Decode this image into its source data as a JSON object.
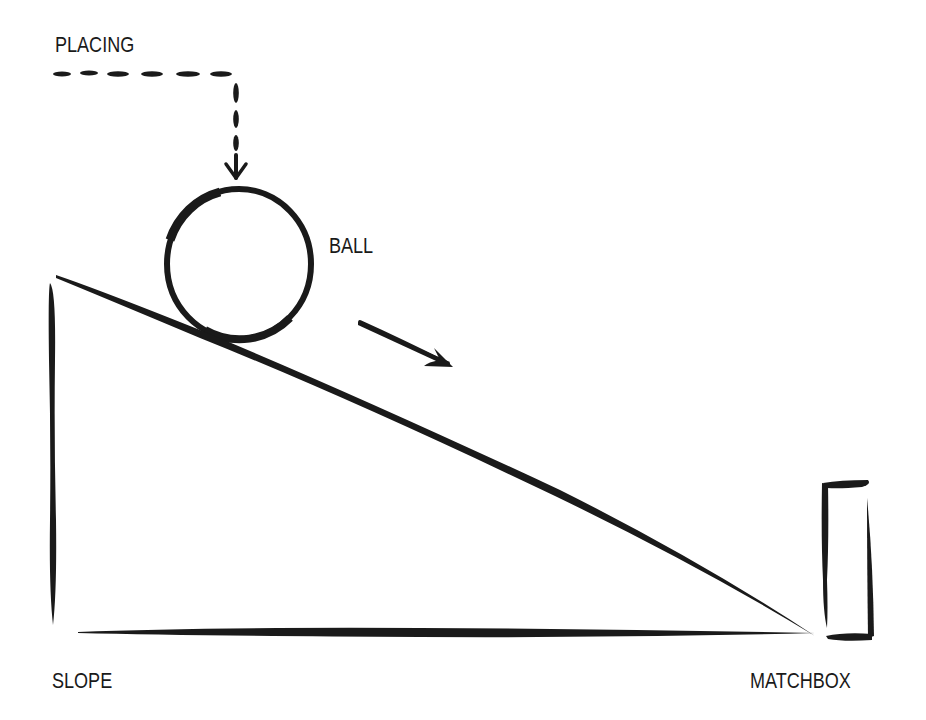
{
  "diagram": {
    "title": "",
    "ink_color": "#1a1a1a",
    "background": "#ffffff",
    "labels": {
      "placing": "PLACING",
      "ball": "BALL",
      "slope": "SLOPE",
      "matchbox": "MATCHBOX"
    },
    "elements": [
      {
        "id": "placing-path",
        "type": "dashed-arrow",
        "description": "dashed path going right then down into the ball"
      },
      {
        "id": "ball",
        "type": "circle",
        "description": "ball resting at top of slope"
      },
      {
        "id": "motion-arrow",
        "type": "arrow",
        "description": "arrow indicating ball rolls down slope"
      },
      {
        "id": "slope",
        "type": "right-triangle",
        "description": "inclined plane"
      },
      {
        "id": "matchbox",
        "type": "rectangle",
        "description": "matchbox at the bottom of the slope"
      }
    ]
  }
}
